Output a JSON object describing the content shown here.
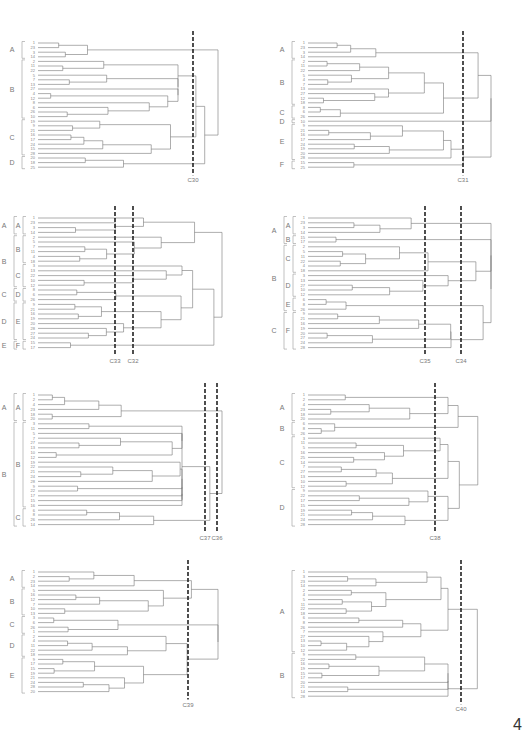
{
  "page_number": "4",
  "chart_data": [
    {
      "type": "dendrogram",
      "id": "p1",
      "cut_lines": [
        "C30"
      ],
      "leaves": [
        "1",
        "23",
        "3",
        "14",
        "2",
        "11",
        "22",
        "5",
        "7",
        "13",
        "27",
        "4",
        "12",
        "8",
        "6",
        "26",
        "10",
        "19",
        "9",
        "21",
        "16",
        "17",
        "24",
        "15",
        "28",
        "20",
        "18",
        "25"
      ],
      "groups": [
        {
          "label": "A",
          "from": 0,
          "to": 3
        },
        {
          "label": "B",
          "from": 4,
          "to": 16
        },
        {
          "label": "C",
          "from": 17,
          "to": 24
        },
        {
          "label": "D",
          "from": 25,
          "to": 27
        }
      ]
    },
    {
      "type": "dendrogram",
      "id": "p2",
      "cut_lines": [
        "C31"
      ],
      "leaves": [
        "1",
        "23",
        "3",
        "14",
        "2",
        "11",
        "22",
        "5",
        "4",
        "7",
        "13",
        "27",
        "12",
        "18",
        "8",
        "6",
        "26",
        "10",
        "9",
        "21",
        "16",
        "17",
        "24",
        "19",
        "20",
        "28",
        "15",
        "25"
      ],
      "groups": [
        {
          "label": "A",
          "from": 0,
          "to": 3
        },
        {
          "label": "B",
          "from": 4,
          "to": 13
        },
        {
          "label": "C",
          "from": 14,
          "to": 16
        },
        {
          "label": "D",
          "from": 17,
          "to": 17
        },
        {
          "label": "E",
          "from": 18,
          "to": 25
        },
        {
          "label": "F",
          "from": 26,
          "to": 27
        }
      ]
    },
    {
      "type": "dendrogram",
      "id": "p3",
      "cut_lines": [
        "C33",
        "C32"
      ],
      "leaves": [
        "1",
        "23",
        "3",
        "14",
        "2",
        "5",
        "7",
        "11",
        "4",
        "18",
        "3",
        "13",
        "22",
        "10",
        "12",
        "8",
        "6",
        "26",
        "9",
        "21",
        "16",
        "19",
        "20",
        "28",
        "27",
        "24",
        "15",
        "17"
      ],
      "groups_outer": [
        {
          "label": "A",
          "from": 0,
          "to": 3
        },
        {
          "label": "B",
          "from": 4,
          "to": 14
        },
        {
          "label": "C",
          "from": 15,
          "to": 17
        },
        {
          "label": "D",
          "from": 18,
          "to": 25
        },
        {
          "label": "E",
          "from": 26,
          "to": 27
        }
      ],
      "groups_inner": [
        {
          "label": "A",
          "from": 0,
          "to": 3
        },
        {
          "label": "B",
          "from": 4,
          "to": 9
        },
        {
          "label": "C",
          "from": 10,
          "to": 14
        },
        {
          "label": "D",
          "from": 15,
          "to": 17
        },
        {
          "label": "E",
          "from": 18,
          "to": 25
        },
        {
          "label": "F",
          "from": 26,
          "to": 27
        }
      ]
    },
    {
      "type": "dendrogram",
      "id": "p4",
      "cut_lines": [
        "C35",
        "C34"
      ],
      "leaves": [
        "1",
        "23",
        "3",
        "14",
        "15",
        "17",
        "2",
        "5",
        "11",
        "22",
        "4",
        "18",
        "3",
        "13",
        "27",
        "10",
        "12",
        "6",
        "8",
        "26",
        "9",
        "21",
        "16",
        "19",
        "20",
        "27",
        "24",
        "28"
      ],
      "groups_outer": [
        {
          "label": "A",
          "from": 0,
          "to": 5
        },
        {
          "label": "B",
          "from": 6,
          "to": 19
        },
        {
          "label": "C",
          "from": 20,
          "to": 27
        }
      ],
      "groups_inner": [
        {
          "label": "A",
          "from": 0,
          "to": 3
        },
        {
          "label": "B",
          "from": 4,
          "to": 5
        },
        {
          "label": "C",
          "from": 6,
          "to": 11
        },
        {
          "label": "D",
          "from": 12,
          "to": 16
        },
        {
          "label": "E",
          "from": 17,
          "to": 19
        },
        {
          "label": "F",
          "from": 20,
          "to": 27
        }
      ]
    },
    {
      "type": "dendrogram",
      "id": "p5",
      "cut_lines": [
        "C37",
        "C36"
      ],
      "leaves": [
        "1",
        "2",
        "4",
        "23",
        "18",
        "20",
        "3",
        "11",
        "5",
        "7",
        "27",
        "13",
        "10",
        "12",
        "19",
        "22",
        "21",
        "24",
        "28",
        "9",
        "22",
        "17",
        "15",
        "16",
        "6",
        "8",
        "26",
        "14"
      ],
      "groups_outer": [
        {
          "label": "A",
          "from": 0,
          "to": 5
        },
        {
          "label": "B",
          "from": 6,
          "to": 27
        }
      ],
      "groups_inner": [
        {
          "label": "A",
          "from": 0,
          "to": 5
        },
        {
          "label": "B",
          "from": 6,
          "to": 23
        },
        {
          "label": "C",
          "from": 24,
          "to": 27
        }
      ]
    },
    {
      "type": "dendrogram",
      "id": "p6",
      "cut_lines": [
        "C38"
      ],
      "leaves": [
        "1",
        "2",
        "4",
        "23",
        "18",
        "20",
        "6",
        "8",
        "26",
        "3",
        "11",
        "5",
        "16",
        "25",
        "14",
        "7",
        "27",
        "13",
        "10",
        "12",
        "9",
        "22",
        "17",
        "15",
        "19",
        "21",
        "24",
        "28"
      ],
      "groups": [
        {
          "label": "A",
          "from": 0,
          "to": 5
        },
        {
          "label": "B",
          "from": 6,
          "to": 8
        },
        {
          "label": "C",
          "from": 9,
          "to": 19
        },
        {
          "label": "D",
          "from": 20,
          "to": 27
        }
      ]
    },
    {
      "type": "dendrogram",
      "id": "p7",
      "cut_lines": [
        "C39"
      ],
      "leaves": [
        "1",
        "2",
        "23",
        "14",
        "5",
        "16",
        "12",
        "7",
        "10",
        "13",
        "3",
        "6",
        "26",
        "1",
        "2",
        "4",
        "11",
        "22",
        "18",
        "9",
        "17",
        "15",
        "19",
        "21",
        "24",
        "28",
        "20"
      ],
      "groups": [
        {
          "label": "A",
          "from": 0,
          "to": 3
        },
        {
          "label": "B",
          "from": 4,
          "to": 9
        },
        {
          "label": "C",
          "from": 10,
          "to": 13
        },
        {
          "label": "D",
          "from": 14,
          "to": 18
        },
        {
          "label": "E",
          "from": 19,
          "to": 26
        }
      ]
    },
    {
      "type": "dendrogram",
      "id": "p8",
      "cut_lines": [
        "C40"
      ],
      "leaves": [
        "1",
        "3",
        "23",
        "14",
        "2",
        "4",
        "5",
        "11",
        "22",
        "18",
        "6",
        "8",
        "26",
        "7",
        "27",
        "13",
        "10",
        "12",
        "9",
        "22",
        "16",
        "19",
        "15",
        "17",
        "20",
        "21",
        "14",
        "28"
      ],
      "groups": [
        {
          "label": "A",
          "from": 0,
          "to": 17
        },
        {
          "label": "B",
          "from": 18,
          "to": 27
        }
      ]
    }
  ]
}
